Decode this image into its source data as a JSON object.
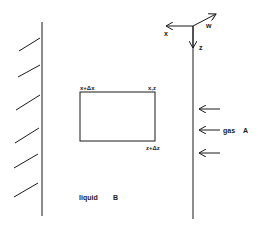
{
  "diagram": {
    "axes": {
      "x_label": "x",
      "z_label": "z",
      "w_label": "w"
    },
    "element": {
      "top_left_label": "x+Δx",
      "top_right_label": "x,z",
      "bottom_right_label": "z+Δz"
    },
    "gas": {
      "label": "gas",
      "species": "A",
      "arrow_count": 3
    },
    "liquid": {
      "label": "liquid",
      "species": "B"
    },
    "colors": {
      "line": "#1a1a1a",
      "background": "#ffffff"
    }
  }
}
